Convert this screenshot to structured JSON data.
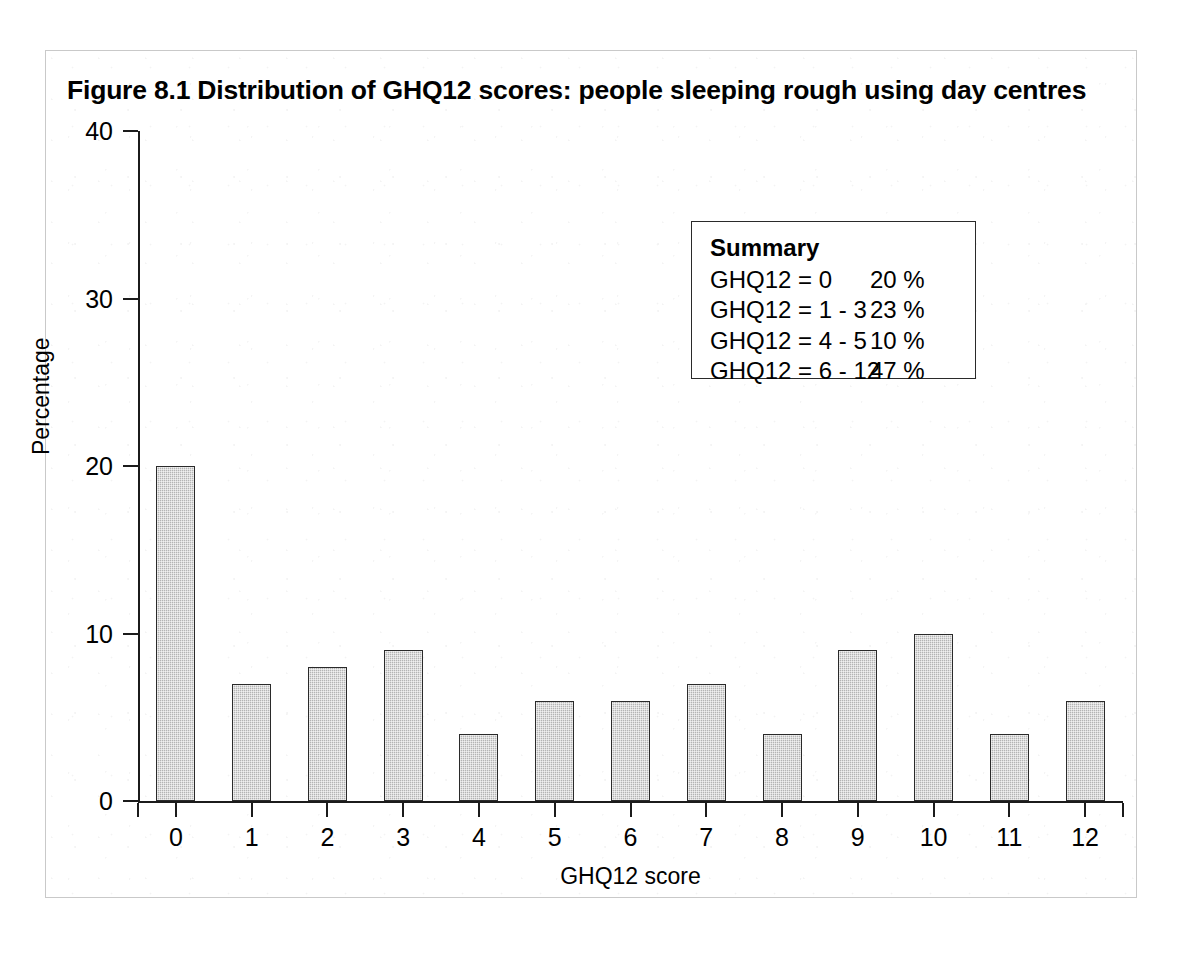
{
  "figure": {
    "title": "Figure 8.1  Distribution of GHQ12 scores: people sleeping rough using day centres"
  },
  "summary": {
    "heading": "Summary",
    "rows": [
      {
        "label": "GHQ12 = 0",
        "value": "20 %"
      },
      {
        "label": "GHQ12 = 1 - 3",
        "value": "23 %"
      },
      {
        "label": "GHQ12 = 4 - 5",
        "value": "10 %"
      },
      {
        "label": "GHQ12 = 6 - 12",
        "value": "47 %"
      }
    ]
  },
  "chart_data": {
    "type": "bar",
    "title": "Figure 8.1  Distribution of GHQ12 scores: people sleeping rough using day centres",
    "xlabel": "GHQ12 score",
    "ylabel": "Percentage",
    "categories": [
      "0",
      "1",
      "2",
      "3",
      "4",
      "5",
      "6",
      "7",
      "8",
      "9",
      "10",
      "11",
      "12"
    ],
    "values": [
      20,
      7,
      8,
      9,
      4,
      6,
      6,
      7,
      4,
      9,
      10,
      4,
      6
    ],
    "ylim": [
      0,
      40
    ],
    "yticks": [
      "0",
      "10",
      "20",
      "30",
      "40"
    ],
    "ytick_values": [
      0,
      10,
      20,
      30,
      40
    ],
    "grid": false,
    "legend": false,
    "bar_fill_color": "#b4b4b4",
    "bar_edge_color": "#2a2a2a",
    "axis_color": "#1b1b1b"
  }
}
